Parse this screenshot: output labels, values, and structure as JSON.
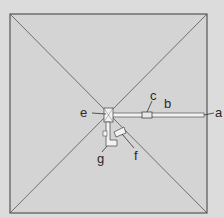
{
  "diagram": {
    "type": "pyramid-plan",
    "colors": {
      "background": "#dcdcdc",
      "fill": "#d4d4d4",
      "line": "#555555",
      "text": "#2a2a2a"
    },
    "labels": {
      "a": "a",
      "b": "b",
      "c": "c",
      "e": "e",
      "f": "f",
      "g": "g"
    }
  }
}
